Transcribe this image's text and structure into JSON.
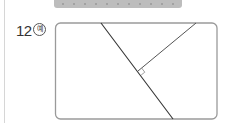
{
  "question": {
    "number": "12",
    "badge": "예"
  },
  "header_bar": {
    "dots": 11,
    "color": "#bdbdbd"
  },
  "figure": {
    "rectangle": {
      "x": 55,
      "y": 23,
      "width": 162,
      "height": 96,
      "rx": 5,
      "stroke": "#9a9a9a"
    },
    "long_line": {
      "x1": 101,
      "y1": 23,
      "x2": 173,
      "y2": 119,
      "stroke": "#333333"
    },
    "perpendicular_line": {
      "x1": 138,
      "y1": 71,
      "x2": 196,
      "y2": 23,
      "stroke": "#555555"
    },
    "right_angle_mark": true
  }
}
